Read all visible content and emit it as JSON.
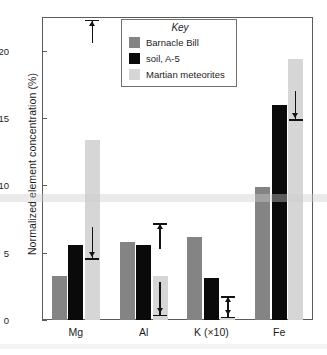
{
  "chart_data": {
    "type": "bar",
    "title": "",
    "xlabel": "",
    "ylabel": "Normalized element concentration (%)",
    "categories": [
      "Mg",
      "Al",
      "K (×10)",
      "Fe"
    ],
    "ylim": [
      0,
      22.5
    ],
    "yticks": [
      0,
      5,
      10,
      15,
      20
    ],
    "ytick_labels": [
      "0",
      "5",
      "10",
      "15",
      "20"
    ],
    "grid": false,
    "legend_position": "top-center",
    "legend_title": "Key",
    "series": [
      {
        "name": "Barnacle Bill",
        "color": "#848484",
        "values": [
          3.3,
          5.8,
          6.2,
          9.9
        ]
      },
      {
        "name": "soil, A-5",
        "color": "#0a0a0a",
        "values": [
          5.6,
          5.6,
          3.1,
          16.0
        ]
      },
      {
        "name": "Martian meteorites",
        "color": "#d6d6d6",
        "values": [
          13.4,
          3.3,
          0.25,
          19.4
        ]
      }
    ],
    "annotations": [
      {
        "id": "mg-upper-limit",
        "category": "Mg",
        "direction": "up",
        "from": 20.6,
        "to": 22.3,
        "label": ""
      },
      {
        "id": "mg-lower-limit",
        "category": "Mg",
        "direction": "down",
        "from": 6.9,
        "to": 4.6,
        "label": ""
      },
      {
        "id": "al-upper-limit",
        "category": "Al",
        "direction": "up",
        "from": 5.3,
        "to": 7.2,
        "label": ""
      },
      {
        "id": "al-lower-limit",
        "category": "Al",
        "direction": "down",
        "from": 2.8,
        "to": 0.4,
        "label": ""
      },
      {
        "id": "k-upper-limit",
        "category": "K (×10)",
        "direction": "up",
        "from": 0.7,
        "to": 1.75,
        "label": ""
      },
      {
        "id": "k-lower-limit",
        "category": "K (×10)",
        "direction": "down",
        "from": 1.6,
        "to": 0.25,
        "label": ""
      },
      {
        "id": "fe-lower-limit",
        "category": "Fe",
        "direction": "down",
        "from": 17.0,
        "to": 14.9,
        "label": ""
      }
    ]
  }
}
